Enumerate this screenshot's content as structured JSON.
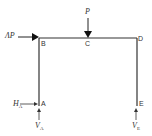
{
  "diagram": {
    "type": "portal frame structural diagram",
    "nodes": [
      {
        "id": "A",
        "label": "A"
      },
      {
        "id": "B",
        "label": "B"
      },
      {
        "id": "C",
        "label": "C"
      },
      {
        "id": "D",
        "label": "D"
      },
      {
        "id": "E",
        "label": "E"
      }
    ],
    "loads": {
      "vertical": {
        "label": "P",
        "at": "C"
      },
      "horizontal": {
        "label": "ΛP",
        "at": "B"
      }
    },
    "reactions": {
      "HA": {
        "label": "H",
        "sub": "A"
      },
      "VA": {
        "label": "V",
        "sub": "A"
      },
      "VE": {
        "label": "V",
        "sub": "E"
      }
    },
    "colors": {
      "line": "#333333",
      "background": "#ffffff"
    }
  }
}
